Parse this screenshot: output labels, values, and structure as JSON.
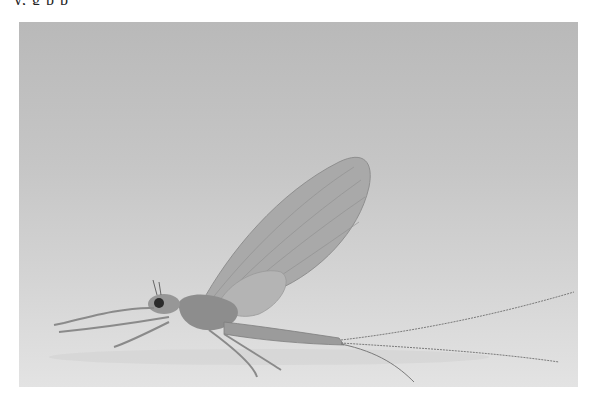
{
  "page": {
    "clipped_text": "y,                 g              p            p"
  },
  "photo": {
    "subject": "mayfly",
    "description": "Grayscale photograph of a mayfly in side view with a large upright translucent wing, long forelegs extended left, and long tail filaments trailing to the right",
    "colors": {
      "background_top": "#b9b9b9",
      "background_bottom": "#e3e3e3",
      "wing": "#a9a9a9",
      "body": "#8a8a8a",
      "dark_detail": "#2a2a2a"
    }
  }
}
